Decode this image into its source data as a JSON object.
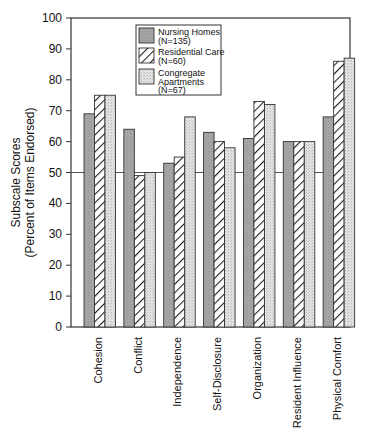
{
  "chart_data": {
    "type": "bar",
    "title": "",
    "xlabel": "",
    "ylabel": "Subscale Scores (Percent of Items Endorsed)",
    "ylabel_lines": [
      "Subscale Scores",
      "(Percent of Items Endorsed)"
    ],
    "ylim": [
      0,
      100
    ],
    "yticks": [
      0,
      10,
      20,
      30,
      40,
      50,
      60,
      70,
      80,
      90,
      100
    ],
    "reference_line": 50,
    "grid": false,
    "legend_position": "upper-center-inside",
    "categories": [
      "Cohesion",
      "Conflict",
      "Independence",
      "Self-Disclosure",
      "Organization",
      "Resident Influence",
      "Physical Comfort"
    ],
    "series": [
      {
        "name": "Nursing Homes (N=135)",
        "label_lines": [
          "Nursing Homes",
          "(N=135)"
        ],
        "pattern": "solid-gray",
        "color": "#a8a8a8",
        "values": [
          69,
          64,
          53,
          63,
          61,
          60,
          68
        ]
      },
      {
        "name": "Residential Care (N=60)",
        "label_lines": [
          "Residential Care",
          "(N=60)"
        ],
        "pattern": "diagonal-hatch",
        "color": "#ffffff",
        "values": [
          75,
          49,
          55,
          60,
          73,
          60,
          86
        ]
      },
      {
        "name": "Congregate Apartments (N=67)",
        "label_lines": [
          "Congregate",
          "Apartments",
          "(N=67)"
        ],
        "pattern": "light-stipple",
        "color": "#dcdcdc",
        "values": [
          75,
          50,
          68,
          58,
          72,
          60,
          87
        ]
      }
    ]
  }
}
